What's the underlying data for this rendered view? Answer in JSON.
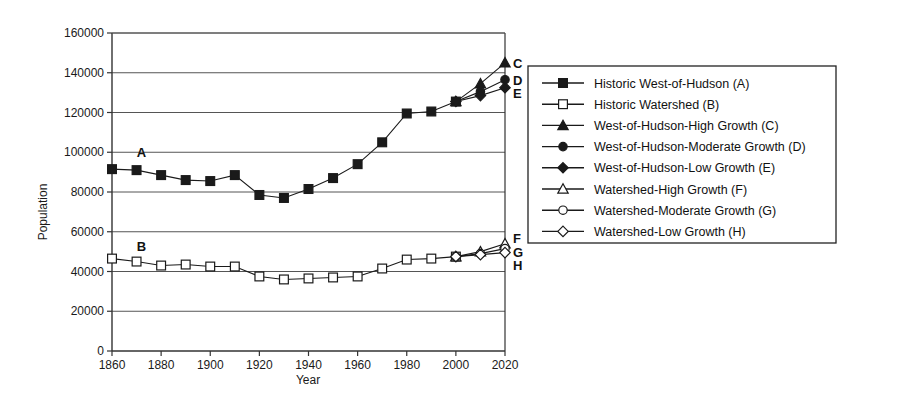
{
  "chart_data": {
    "type": "line",
    "title": "",
    "xlabel": "Year",
    "ylabel": "Population",
    "xlim": [
      1860,
      2020
    ],
    "ylim": [
      0,
      160000
    ],
    "xticks": [
      1860,
      1880,
      1900,
      1920,
      1940,
      1960,
      1980,
      2000,
      2020
    ],
    "yticks": [
      0,
      20000,
      40000,
      60000,
      80000,
      100000,
      120000,
      140000,
      160000
    ],
    "ytick_labels": [
      "0",
      "20000",
      "40000",
      "60000",
      "80000",
      "100000",
      "120000",
      "140000",
      "160000"
    ],
    "xtick_labels": [
      "1860",
      "1880",
      "1900",
      "1920",
      "1940",
      "1960",
      "1980",
      "2000",
      "2020"
    ],
    "grid": "horizontal",
    "legend_position": "right-outside",
    "series": [
      {
        "name": "Historic West-of-Hudson (A)",
        "key": "A",
        "marker": "filled-square",
        "x": [
          1860,
          1870,
          1880,
          1890,
          1900,
          1910,
          1920,
          1930,
          1940,
          1950,
          1960,
          1970,
          1980,
          1990,
          2000
        ],
        "values": [
          91500,
          91000,
          88500,
          86000,
          85500,
          88500,
          78500,
          77000,
          81500,
          87000,
          94000,
          105000,
          119500,
          120500,
          125500
        ]
      },
      {
        "name": "Historic Watershed (B)",
        "key": "B",
        "marker": "open-square",
        "x": [
          1860,
          1870,
          1880,
          1890,
          1900,
          1910,
          1920,
          1930,
          1940,
          1950,
          1960,
          1970,
          1980,
          1990,
          2000
        ],
        "values": [
          46500,
          45000,
          43000,
          43500,
          42500,
          42500,
          37500,
          36000,
          36500,
          37000,
          37500,
          41500,
          46000,
          46500,
          47500
        ]
      },
      {
        "name": "West-of-Hudson-High Growth (C)",
        "key": "C",
        "marker": "filled-triangle",
        "x": [
          2000,
          2010,
          2020
        ],
        "values": [
          125500,
          134500,
          145000
        ]
      },
      {
        "name": "West-of-Hudson-Moderate Growth (D)",
        "key": "D",
        "marker": "filled-circle",
        "x": [
          2000,
          2010,
          2020
        ],
        "values": [
          125500,
          130500,
          136500
        ]
      },
      {
        "name": "West-of-Hudson-Low Growth (E)",
        "key": "E",
        "marker": "filled-diamond",
        "x": [
          2000,
          2010,
          2020
        ],
        "values": [
          125500,
          128500,
          132500
        ]
      },
      {
        "name": "Watershed-High Growth (F)",
        "key": "F",
        "marker": "open-triangle",
        "x": [
          2000,
          2010,
          2020
        ],
        "values": [
          47500,
          50000,
          54000
        ]
      },
      {
        "name": "Watershed-Moderate Growth (G)",
        "key": "G",
        "marker": "open-circle",
        "x": [
          2000,
          2010,
          2020
        ],
        "values": [
          47500,
          49000,
          51500
        ]
      },
      {
        "name": "Watershed-Low Growth (H)",
        "key": "H",
        "marker": "open-diamond",
        "x": [
          2000,
          2010,
          2020
        ],
        "values": [
          47500,
          48500,
          49500
        ]
      }
    ],
    "inline_annotations": [
      {
        "text": "A",
        "x": 1872,
        "y": 100000
      },
      {
        "text": "B",
        "x": 1872,
        "y": 53000
      }
    ],
    "right_edge_labels": [
      {
        "text": "C",
        "y": 145000
      },
      {
        "text": "D",
        "y": 136500
      },
      {
        "text": "E",
        "y": 130000
      },
      {
        "text": "F",
        "y": 57000
      },
      {
        "text": "G",
        "y": 50000
      },
      {
        "text": "H",
        "y": 43500
      }
    ]
  },
  "legend": {
    "entries": [
      {
        "label": "Historic West-of-Hudson (A)",
        "marker": "filled-square"
      },
      {
        "label": "Historic Watershed (B)",
        "marker": "open-square"
      },
      {
        "label": "West-of-Hudson-High Growth (C)",
        "marker": "filled-triangle"
      },
      {
        "label": "West-of-Hudson-Moderate Growth (D)",
        "marker": "filled-circle"
      },
      {
        "label": "West-of-Hudson-Low Growth (E)",
        "marker": "filled-diamond"
      },
      {
        "label": "Watershed-High Growth (F)",
        "marker": "open-triangle"
      },
      {
        "label": "Watershed-Moderate Growth (G)",
        "marker": "open-circle"
      },
      {
        "label": "Watershed-Low Growth (H)",
        "marker": "open-diamond"
      }
    ]
  },
  "colors": {
    "line": "#1a1a1a",
    "grid": "#555555",
    "axis": "#333333",
    "background": "#ffffff",
    "text": "#111111"
  }
}
